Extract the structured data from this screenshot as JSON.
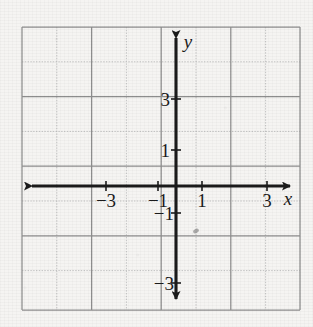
{
  "figure": {
    "kind": "cartesian-coordinate-grid",
    "background_color": "#f5f4f2",
    "ink_color": "#1b1b1b",
    "major_grid_color": "#8d8d8d",
    "minor_grid_color": "#c2c2c2",
    "grid": {
      "left": 22,
      "top": 27,
      "right": 300,
      "bottom": 310,
      "columns": 8,
      "rows": 8,
      "cell_px": 34.8
    },
    "origin": {
      "x_px": 176,
      "y_px": 186
    },
    "axes": {
      "x": {
        "label": "x",
        "label_x_px": 288,
        "label_y_px": 205,
        "arrow_start": "left",
        "arrow_end": "right",
        "x1_px": 26,
        "x2_px": 296,
        "y_px": 186,
        "range": [
          -4,
          4
        ],
        "tick_values": [
          -3,
          -1,
          1,
          3
        ],
        "tick_labels": [
          "−3",
          "−1",
          "1",
          "3"
        ]
      },
      "y": {
        "label": "y",
        "label_x_px": 188,
        "label_y_px": 48,
        "arrow_start": "bottom",
        "arrow_end": "top",
        "y1_px": 31,
        "y2_px": 306,
        "x_px": 176,
        "range": [
          -4,
          4
        ],
        "tick_values": [
          3,
          1,
          -1,
          -3
        ],
        "tick_labels": [
          "3",
          "1",
          "−1",
          "−3"
        ]
      }
    },
    "x_tick_marks": [
      {
        "label": "−3",
        "value": -3,
        "cx": 106,
        "text_x": 106,
        "text_y": 207
      },
      {
        "label": "−1",
        "value": -1,
        "cx": 158,
        "text_x": 158,
        "text_y": 207
      },
      {
        "label": "1",
        "value": 1,
        "cx": 202,
        "text_x": 202,
        "text_y": 207
      },
      {
        "label": "3",
        "value": 3,
        "cx": 267,
        "text_x": 267,
        "text_y": 207
      }
    ],
    "y_tick_marks": [
      {
        "label": "3",
        "value": 3,
        "cy": 99,
        "text_x": 167,
        "text_y": 106
      },
      {
        "label": "1",
        "value": 1,
        "cy": 150,
        "text_x": 167,
        "text_y": 157
      },
      {
        "label": "−1",
        "value": -1,
        "cy": 213,
        "text_x": 167,
        "text_y": 220
      },
      {
        "label": "−3",
        "value": -3,
        "cy": 283,
        "text_x": 167,
        "text_y": 290
      }
    ],
    "artifacts": [
      {
        "name": "scan-smudge",
        "cx": 196,
        "cy": 231,
        "r": 2.6
      }
    ]
  }
}
